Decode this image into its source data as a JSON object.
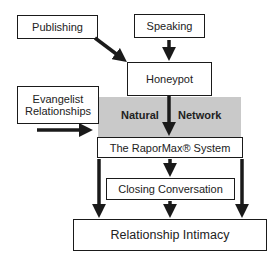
{
  "diagram": {
    "nodes": {
      "publishing": "Publishing",
      "speaking": "Speaking",
      "honeypot": "Honeypot",
      "evangelist": "Evangelist Relationships",
      "evangelist_line1": "Evangelist",
      "evangelist_line2": "Relationships",
      "natural": "Natural",
      "network": "Network",
      "rapormax": "The RaporMax® System",
      "closing": "Closing Conversation",
      "intimacy": "Relationship Intimacy"
    },
    "edges": [
      {
        "from": "Publishing",
        "to": "Honeypot"
      },
      {
        "from": "Speaking",
        "to": "Honeypot"
      },
      {
        "from": "Honeypot",
        "to": "The RaporMax® System"
      },
      {
        "from": "Evangelist Relationships",
        "to": "Natural Network"
      },
      {
        "from": "The RaporMax® System",
        "to": "Closing Conversation"
      },
      {
        "from": "Closing Conversation",
        "to": "Relationship Intimacy"
      },
      {
        "from": "The RaporMax® System",
        "to": "Relationship Intimacy",
        "side": "left"
      },
      {
        "from": "The RaporMax® System",
        "to": "Relationship Intimacy",
        "side": "right"
      }
    ],
    "colors": {
      "stroke": "#1a1a1a",
      "region": "#c9c9c9",
      "background": "#ffffff"
    }
  }
}
